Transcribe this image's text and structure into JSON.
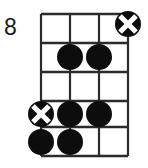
{
  "diagram": {
    "instrument_label": "bass-chord-diagram",
    "position_label": "8",
    "strings": 4,
    "frets": 5,
    "colors": {
      "line": "#2b2b2b",
      "dot": "#0d0d0d",
      "marker_cross": "#ffffff",
      "background": "#ffffff",
      "label_text": "#1a1a1a"
    },
    "geometry": {
      "string_x": [
        41,
        70,
        99,
        128
      ],
      "fret_y": [
        14,
        43,
        72,
        101,
        127,
        156
      ],
      "dot_radius": 13,
      "marker_radius": 13
    },
    "markers": [
      {
        "id": "marker-1",
        "type": "circled-x",
        "string": 4,
        "fret": 1,
        "cx": 128,
        "cy": 24
      },
      {
        "id": "marker-2",
        "type": "filled-dot",
        "string": 2,
        "fret": 2,
        "cx": 70,
        "cy": 57
      },
      {
        "id": "marker-3",
        "type": "filled-dot",
        "string": 3,
        "fret": 2,
        "cx": 99,
        "cy": 57
      },
      {
        "id": "marker-4",
        "type": "circled-x",
        "string": 1,
        "fret": 4,
        "cx": 41,
        "cy": 114
      },
      {
        "id": "marker-5",
        "type": "filled-dot",
        "string": 2,
        "fret": 4,
        "cx": 70,
        "cy": 114
      },
      {
        "id": "marker-6",
        "type": "filled-dot",
        "string": 3,
        "fret": 4,
        "cx": 99,
        "cy": 114
      },
      {
        "id": "marker-7",
        "type": "filled-dot",
        "string": 1,
        "fret": 5,
        "cx": 41,
        "cy": 142
      },
      {
        "id": "marker-8",
        "type": "filled-dot",
        "string": 2,
        "fret": 5,
        "cx": 70,
        "cy": 142
      }
    ],
    "label_position": {
      "x": 4,
      "y": 16
    }
  }
}
